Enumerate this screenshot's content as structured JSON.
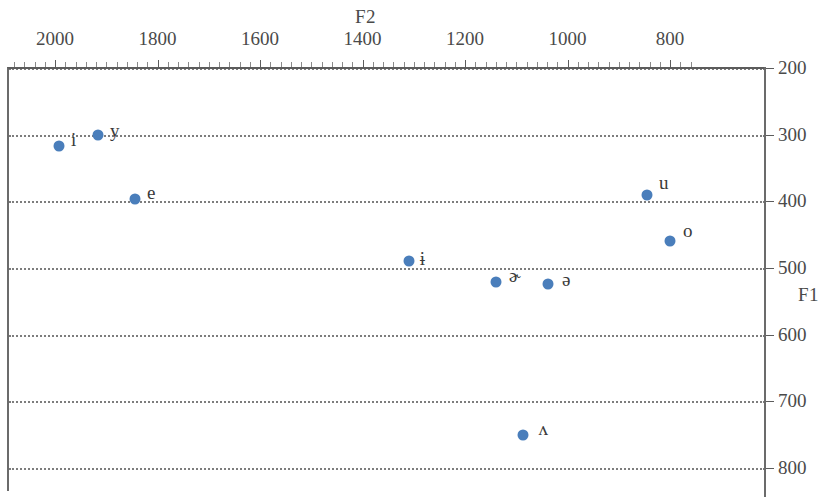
{
  "chart_data": {
    "type": "scatter",
    "title": "",
    "xlabel": "F2",
    "ylabel": "F1",
    "xlim": [
      2100,
      750
    ],
    "ylim": [
      200,
      830
    ],
    "x_axis_position": "top",
    "y_axis_position": "right",
    "x_reversed": true,
    "y_reversed": true,
    "grid": "horizontal-dotted",
    "legend": "none",
    "xticks": [
      2000,
      1800,
      1600,
      1400,
      1200,
      1000,
      800
    ],
    "xtick_labels": [
      "2000",
      "1800",
      "1600",
      "1400",
      "1200",
      "1000",
      "800"
    ],
    "yticks": [
      200,
      300,
      400,
      500,
      600,
      700,
      800
    ],
    "ytick_labels": [
      "200",
      "300",
      "400",
      "500",
      "600",
      "700",
      "800"
    ],
    "marker_color": "#4a7ebb",
    "points": [
      {
        "label": "i",
        "F2": 1992,
        "F1": 317,
        "label_dx": 12,
        "label_dy": -6
      },
      {
        "label": "y",
        "F2": 1916,
        "F1": 300,
        "label_dx": 12,
        "label_dy": -4
      },
      {
        "label": "e",
        "F2": 1844,
        "F1": 397,
        "label_dx": 12,
        "label_dy": -6
      },
      {
        "label": "ɨ",
        "F2": 1310,
        "F1": 490,
        "label_dx": 11,
        "label_dy": -2
      },
      {
        "label": "ɚ",
        "F2": 1140,
        "F1": 521,
        "label_dx": 13,
        "label_dy": -6
      },
      {
        "label": "ə",
        "F2": 1038,
        "F1": 524,
        "label_dx": 14,
        "label_dy": -4
      },
      {
        "label": "u",
        "F2": 845,
        "F1": 390,
        "label_dx": 12,
        "label_dy": -12
      },
      {
        "label": "o",
        "F2": 800,
        "F1": 460,
        "label_dx": 13,
        "label_dy": -10
      },
      {
        "label": "ʌ",
        "F2": 1086,
        "F1": 750,
        "label_dx": 15,
        "label_dy": -6
      }
    ]
  },
  "axes": {
    "f2_title": "F2",
    "f1_title": "F1"
  }
}
